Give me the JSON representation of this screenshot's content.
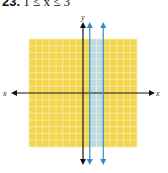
{
  "problem": {
    "number": "23.",
    "inequality": "1 ≤ x ≤ 3"
  },
  "colors": {
    "grid_fill": "#F4D54E",
    "grid_line": "#FBEFB8",
    "band_fill": "#BCD9EA",
    "boundary": "#2E8FC8",
    "axis": "#111111"
  },
  "chart_data": {
    "type": "region",
    "title": "23. 1 ≤ x ≤ 3",
    "xlabel": "x",
    "ylabel": "y",
    "xlim": [
      -8,
      8
    ],
    "ylim": [
      -8,
      8
    ],
    "grid": true,
    "shaded_region": {
      "x_min": 1,
      "x_max": 3,
      "description": "vertical strip between x = 1 and x = 3"
    },
    "boundary_lines": [
      {
        "equation": "x = 1",
        "style": "solid"
      },
      {
        "equation": "x = 3",
        "style": "solid"
      }
    ]
  },
  "axes": {
    "x_label": "x",
    "y_label": "y"
  }
}
